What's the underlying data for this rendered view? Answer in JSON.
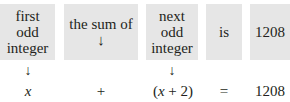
{
  "boxes": [
    {
      "lines": [
        "first",
        "odd",
        "integer"
      ],
      "arrow_below": true
    },
    {
      "lines": [
        "the sum of",
        "↓"
      ],
      "arrow_below": false
    },
    {
      "lines": [
        "next",
        "odd",
        "integer"
      ],
      "arrow_below": true
    },
    {
      "lines": [
        "is"
      ],
      "arrow_below": false
    },
    {
      "lines": [
        "1208"
      ],
      "arrow_below": false
    }
  ],
  "arrow_glyph": "↓",
  "equation": {
    "term1": "x",
    "op1": "+",
    "term2_open": "(",
    "term2_var": "x",
    "term2_rest": " + 2)",
    "op2": "=",
    "result": "1208"
  },
  "colors": {
    "box_fill": "#e6e6e6",
    "text": "#231f20"
  }
}
